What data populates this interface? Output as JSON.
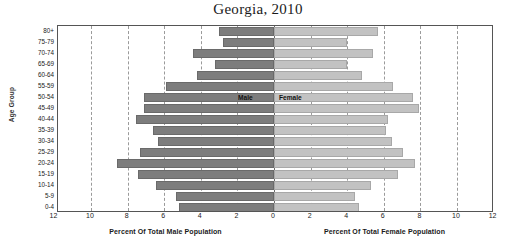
{
  "chart_data": {
    "type": "bar",
    "subtype": "population-pyramid",
    "title": "Georgia, 2010",
    "ylabel": "Age Group",
    "xlabel_left": "Percent Of Total Male Population",
    "xlabel_right": "Percent Of Total Female Population",
    "grid": true,
    "legend_position": "inside-center",
    "xlim_left": [
      0,
      12
    ],
    "xlim_right": [
      0,
      12
    ],
    "xticks_left": [
      "12",
      "10",
      "8",
      "6",
      "4",
      "2",
      "0"
    ],
    "xticks_right": [
      "0",
      "2",
      "4",
      "6",
      "8",
      "10",
      "12"
    ],
    "xtick_values": [
      12,
      10,
      8,
      6,
      4,
      2,
      0,
      2,
      4,
      6,
      8,
      10,
      12
    ],
    "categories": [
      "80+",
      "75-79",
      "70-74",
      "65-69",
      "60-64",
      "55-59",
      "50-54",
      "45-49",
      "40-44",
      "35-39",
      "30-34",
      "25-29",
      "20-24",
      "15-19",
      "10-14",
      "5-9",
      "0-4"
    ],
    "series": [
      {
        "name": "Male",
        "side": "left",
        "color": "#7d7d7d",
        "values": [
          3.0,
          2.8,
          4.4,
          3.2,
          4.2,
          5.9,
          7.1,
          7.1,
          7.55,
          6.6,
          6.35,
          7.3,
          8.6,
          7.45,
          6.45,
          5.35,
          5.2
        ]
      },
      {
        "name": "Female",
        "side": "right",
        "color": "#c2c2c2",
        "values": [
          5.7,
          4.0,
          5.4,
          4.0,
          4.8,
          6.5,
          7.6,
          7.9,
          6.25,
          6.1,
          6.45,
          7.05,
          7.7,
          6.8,
          5.3,
          4.4,
          4.65
        ]
      }
    ]
  },
  "axis": {
    "zero_label": "0"
  }
}
